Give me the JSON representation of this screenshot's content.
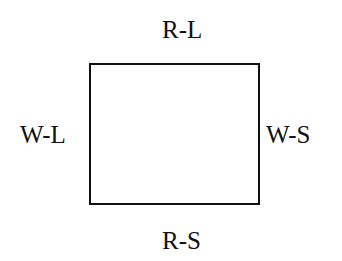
{
  "diagram": {
    "type": "rectangle-with-side-labels",
    "labels": {
      "top": "R-L",
      "left": "W-L",
      "right": "W-S",
      "bottom": "R-S"
    },
    "colors": {
      "line": "#111111",
      "text": "#111111",
      "background": "#ffffff"
    }
  }
}
